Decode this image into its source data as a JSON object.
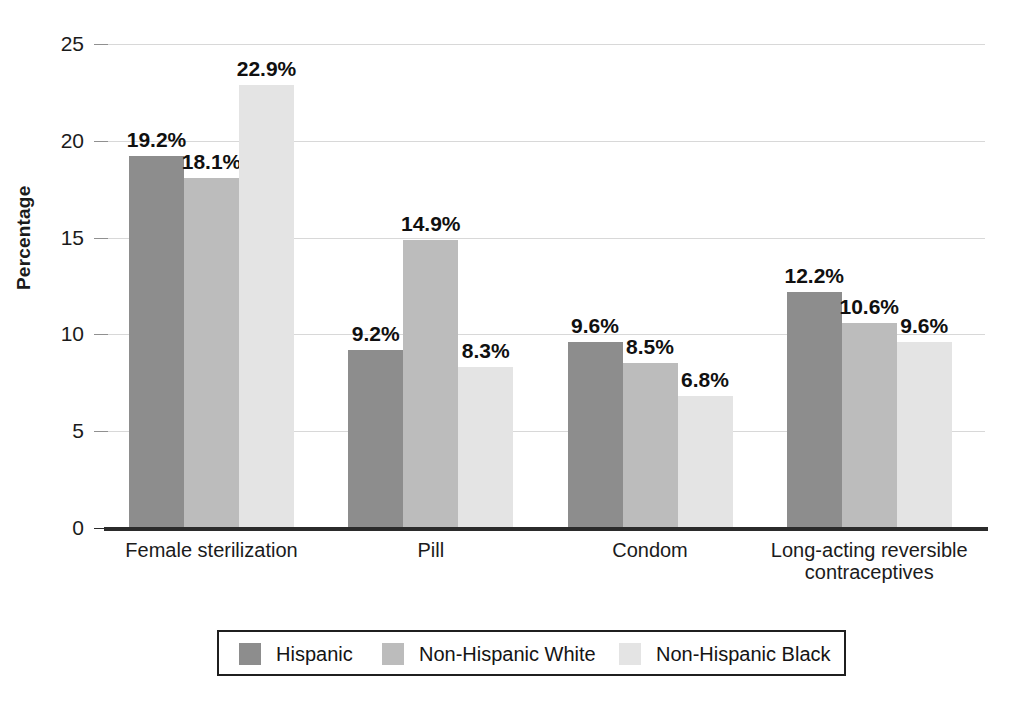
{
  "chart_data": {
    "type": "bar",
    "title": "",
    "subtitle": "",
    "xlabel": "",
    "ylabel": "Percentage",
    "ylim": [
      0,
      25
    ],
    "ytick_values": [
      0,
      5,
      10,
      15,
      20,
      25
    ],
    "ytick_labels": [
      "0",
      "5",
      "10",
      "15",
      "20",
      "25"
    ],
    "grid": true,
    "grid_axis": "y",
    "legend_position": "bottom",
    "value_label_suffix": "%",
    "categories": [
      "Female sterilization",
      "Pill",
      "Condom",
      "Long-acting reversible contraceptives"
    ],
    "category_lines": [
      [
        "Female sterilization"
      ],
      [
        "Pill"
      ],
      [
        "Condom"
      ],
      [
        "Long-acting reversible",
        "contraceptives"
      ]
    ],
    "series": [
      {
        "name": "Hispanic",
        "color": "#8d8d8d",
        "values": [
          19.2,
          9.2,
          9.6,
          12.2
        ],
        "labels": [
          "19.2%",
          "9.2%",
          "9.6%",
          "12.2%"
        ]
      },
      {
        "name": "Non-Hispanic White",
        "color": "#bcbcbc",
        "values": [
          18.1,
          14.9,
          8.5,
          10.6
        ],
        "labels": [
          "18.1%",
          "14.9%",
          "8.5%",
          "10.6%"
        ]
      },
      {
        "name": "Non-Hispanic Black",
        "color": "#e4e4e4",
        "values": [
          22.9,
          8.3,
          6.8,
          9.6
        ],
        "labels": [
          "22.9%",
          "8.3%",
          "6.8%",
          "9.6%"
        ]
      }
    ]
  },
  "legend": {
    "items": [
      {
        "label": "Hispanic",
        "color": "#8d8d8d"
      },
      {
        "label": "Non-Hispanic White",
        "color": "#bcbcbc"
      },
      {
        "label": "Non-Hispanic Black",
        "color": "#e4e4e4"
      }
    ]
  },
  "axis": {
    "y_title": "Percentage"
  },
  "colors": {
    "axis_line": "#2b2b2b",
    "gridline": "#d8d8d8",
    "text": "#1b1b1b",
    "background": "#ffffff"
  }
}
